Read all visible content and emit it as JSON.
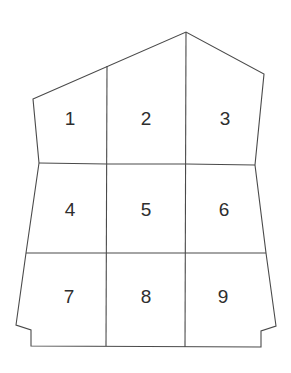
{
  "diagram": {
    "type": "segmented-shape",
    "stroke_color": "#4a4a4a",
    "label_color": "#2e2e2e",
    "outline_points": "33,99 186,32 264,74 255,165 266,253 276,326 261,331 261,347 31,346 31,330 16,325 26,253 39,163",
    "grid_lines": [
      {
        "id": "h-upper",
        "points": "39,163 107,164 186,164 255,165"
      },
      {
        "id": "h-lower",
        "points": "26,253 107,253 186,253 266,253"
      },
      {
        "id": "v-left",
        "points": "107,66 106,346"
      },
      {
        "id": "v-right",
        "points": "186,32 185,347"
      }
    ],
    "cells": [
      {
        "label": "1",
        "x": 70,
        "y": 118
      },
      {
        "label": "2",
        "x": 146,
        "y": 118
      },
      {
        "label": "3",
        "x": 225,
        "y": 118
      },
      {
        "label": "4",
        "x": 70,
        "y": 209
      },
      {
        "label": "5",
        "x": 146,
        "y": 209
      },
      {
        "label": "6",
        "x": 224,
        "y": 209
      },
      {
        "label": "7",
        "x": 69,
        "y": 296
      },
      {
        "label": "8",
        "x": 146,
        "y": 296
      },
      {
        "label": "9",
        "x": 223,
        "y": 296
      }
    ]
  }
}
